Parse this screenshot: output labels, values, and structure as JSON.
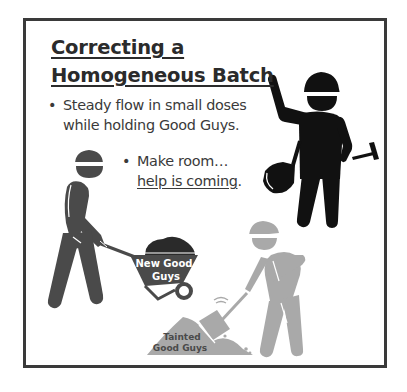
{
  "slide": {
    "title": "Correcting a Homogeneous Batch",
    "bullets": [
      {
        "text": "Steady flow in small doses while holding Good Guys."
      },
      {
        "text_prefix": "Make room…",
        "link_text": "help is coming",
        "suffix": "."
      }
    ]
  },
  "illustration": {
    "wheelbarrow_label_line1": "New Good",
    "wheelbarrow_label_line2": "Guys",
    "pile_label_line1": "Tainted",
    "pile_label_line2": "Good Guys",
    "icons": [
      "worker-standing-icon",
      "worker-wheelbarrow-icon",
      "worker-shoveling-icon",
      "shovel-icon",
      "hammer-icon",
      "dirt-pile-icon"
    ]
  },
  "colors": {
    "frame": "#3a3a3a",
    "title": "#2b2b2b",
    "text": "#3a3a3a",
    "black_worker": "#111111",
    "dark_worker": "#4a4a4a",
    "grey_worker": "#a9a9a9"
  }
}
